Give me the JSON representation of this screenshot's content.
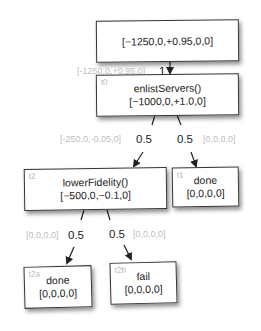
{
  "diagram": {
    "type": "probability-tree",
    "root": {
      "value": "[−1250,0,+0.95,0,0]"
    },
    "nodes": {
      "t0": {
        "tag": "t0",
        "label": "enlistServers()",
        "value": "[−1000,0,+1.0,0]"
      },
      "t1": {
        "tag": "t1",
        "label": "done",
        "value": "[0,0,0,0]"
      },
      "t2": {
        "tag": "t2",
        "label": "lowerFidelity()",
        "value": "[−500,0,−0.1,0]"
      },
      "t2a": {
        "tag": "t2a",
        "label": "done",
        "value": "[0,0,0,0]"
      },
      "t2b": {
        "tag": "t2b",
        "label": "fail",
        "value": "[0,0,0,0]"
      }
    },
    "edges": {
      "root_t0": {
        "vector": "[-1250,0,+0.95,0]",
        "probability": "1"
      },
      "t0_t2": {
        "vector": "[-250,0,-0.05,0]",
        "probability": "0.5"
      },
      "t0_t1": {
        "vector": "[0,0,0,0]",
        "probability": "0.5"
      },
      "t2_t2a": {
        "vector": "[0,0,0,0]",
        "probability": "0.5"
      },
      "t2_t2b": {
        "vector": "[0,0,0,0]",
        "probability": "0.5"
      }
    }
  }
}
